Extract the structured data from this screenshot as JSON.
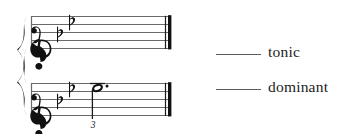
{
  "page": {
    "background_color": "#ffffff",
    "ink_color": "#1a1a1a",
    "rule_color": "#5b5b5b"
  },
  "notation": {
    "system_type": "grand-staff-braced",
    "brace": "curly-brace",
    "final_barline": "thin-thick",
    "key_signature": {
      "name": "B-flat major / G minor",
      "accidental": "flat",
      "count": 2,
      "glyph": "♭"
    },
    "staves": [
      {
        "index": 0,
        "clef": "treble",
        "clef_glyph": "𝄞",
        "key_signature_flats": 2,
        "notes": []
      },
      {
        "index": 1,
        "clef": "treble",
        "clef_glyph": "𝄞",
        "key_signature_flats": 2,
        "notes": [
          {
            "duration": "dotted-half",
            "notehead": "open",
            "dotted": true,
            "stem": "down",
            "ledger_lines_above": 1,
            "fingering": "3"
          }
        ]
      }
    ]
  },
  "answers": {
    "blank_mark": "____",
    "items": [
      {
        "label": "tonic",
        "value": ""
      },
      {
        "label": "dominant",
        "value": ""
      }
    ]
  }
}
